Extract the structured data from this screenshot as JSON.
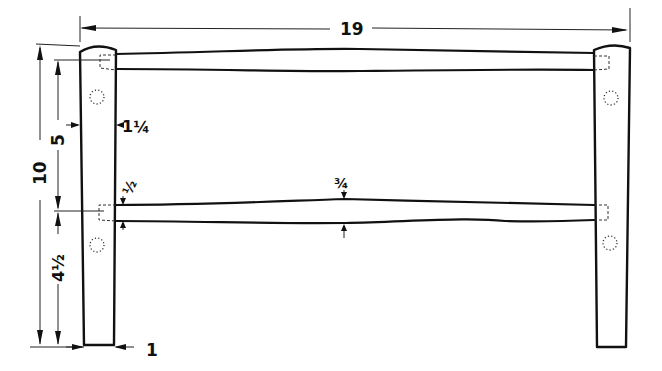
{
  "diagram": {
    "type": "technical-drawing",
    "ink_color": "#111111",
    "background": "#ffffff"
  },
  "dimensions": {
    "overall_width": "19",
    "overall_height": "10",
    "top_rail_to_lower_rail": "5",
    "lower_rail_to_floor": "4 1/2",
    "leg_width_top": "1 1/4",
    "leg_width_bottom": "1",
    "rail_thickness_at_leg": "1/2",
    "rail_thickness_center": "3/4"
  },
  "labels": {
    "width": "19",
    "height_total": "10",
    "height_upper": "5",
    "height_lower": "4½",
    "leg_top": "1¼",
    "leg_bottom": "1",
    "rail_end": "½",
    "rail_mid": "¾"
  }
}
